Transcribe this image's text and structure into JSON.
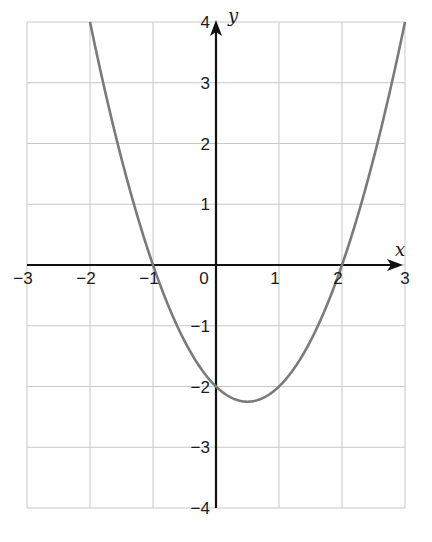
{
  "chart_data": {
    "type": "line",
    "title": "",
    "xlabel": "x",
    "ylabel": "y",
    "xlim": [
      -3,
      3
    ],
    "ylim": [
      -4,
      4
    ],
    "grid": true,
    "x_ticks": [
      "−3",
      "−2",
      "−1",
      "0",
      "1",
      "2",
      "3"
    ],
    "y_ticks": [
      "4",
      "3",
      "2",
      "1",
      "−1",
      "−2",
      "−3",
      "−4"
    ],
    "series": [
      {
        "name": "y = x² − x − 2",
        "color": "#7a7a7a",
        "x": [
          -2,
          -1.5,
          -1,
          -0.5,
          0,
          0.5,
          1,
          1.5,
          2,
          2.5,
          3
        ],
        "y": [
          4,
          1.75,
          0,
          -1.25,
          -2,
          -2.25,
          -2,
          -1.25,
          0,
          1.75,
          4
        ]
      }
    ],
    "annotations": {
      "x_intercepts": [
        -1,
        2
      ],
      "y_intercept": -2,
      "vertex": [
        0.5,
        -2.25
      ]
    }
  },
  "colors": {
    "grid": "#c8c8c8",
    "axis": "#111111",
    "curve": "#7a7a7a"
  }
}
